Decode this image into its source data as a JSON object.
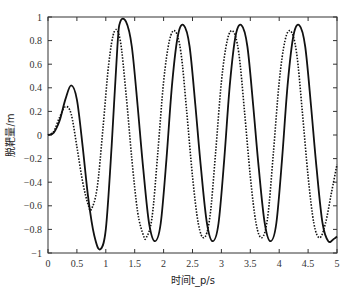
{
  "chart_data": {
    "type": "line",
    "title": "",
    "xlabel": "时间t_p/s",
    "ylabel": "脱靶量/m",
    "xlim": [
      0,
      5
    ],
    "ylim": [
      -1,
      1
    ],
    "xticks": [
      0,
      0.5,
      1,
      1.5,
      2,
      2.5,
      3,
      3.5,
      4,
      4.5,
      5
    ],
    "xtick_labels": [
      "0",
      "0.5",
      "1",
      "1.5",
      "2",
      "2.5",
      "3",
      "3.5",
      "4",
      "4.5",
      "5"
    ],
    "yticks": [
      -1,
      -0.8,
      -0.6,
      -0.4,
      -0.2,
      0,
      0.2,
      0.4,
      0.6,
      0.8,
      1
    ],
    "ytick_labels": [
      "−1",
      "−0.8",
      "−0.6",
      "−0.4",
      "−0.2",
      "0",
      "0.2",
      "0.4",
      "0.6",
      "0.8",
      "1"
    ],
    "grid": false,
    "legend": null,
    "series": [
      {
        "name": "solid",
        "style": "solid",
        "color": "#111111",
        "x": [
          0,
          0.1,
          0.2,
          0.3,
          0.4,
          0.5,
          0.6,
          0.7,
          0.8,
          0.9,
          1.0,
          1.1,
          1.2,
          1.25,
          1.35,
          1.45,
          1.55,
          1.65,
          1.75,
          1.85,
          1.95,
          2.05,
          2.15,
          2.25,
          2.35,
          2.45,
          2.55,
          2.65,
          2.75,
          2.85,
          2.95,
          3.05,
          3.15,
          3.25,
          3.35,
          3.45,
          3.55,
          3.65,
          3.75,
          3.85,
          3.95,
          4.05,
          4.15,
          4.25,
          4.35,
          4.45,
          4.55,
          4.65,
          4.75,
          4.85,
          4.95,
          5.0
        ],
        "y": [
          0,
          0.02,
          0.12,
          0.3,
          0.42,
          0.3,
          -0.1,
          -0.55,
          -0.85,
          -0.97,
          -0.8,
          -0.1,
          0.75,
          0.96,
          0.96,
          0.75,
          0.25,
          -0.3,
          -0.75,
          -0.9,
          -0.75,
          -0.2,
          0.45,
          0.85,
          0.93,
          0.75,
          0.25,
          -0.3,
          -0.75,
          -0.9,
          -0.75,
          -0.2,
          0.45,
          0.85,
          0.93,
          0.75,
          0.25,
          -0.3,
          -0.75,
          -0.9,
          -0.75,
          -0.2,
          0.45,
          0.85,
          0.93,
          0.75,
          0.25,
          -0.3,
          -0.75,
          -0.9,
          -0.88,
          -0.86
        ]
      },
      {
        "name": "dotted",
        "style": "dotted",
        "color": "#111111",
        "x": [
          0,
          0.1,
          0.2,
          0.3,
          0.4,
          0.5,
          0.6,
          0.7,
          0.75,
          0.85,
          0.95,
          1.05,
          1.15,
          1.25,
          1.35,
          1.45,
          1.55,
          1.65,
          1.7,
          1.8,
          1.9,
          2.0,
          2.1,
          2.2,
          2.3,
          2.4,
          2.5,
          2.6,
          2.7,
          2.8,
          2.9,
          3.0,
          3.1,
          3.2,
          3.3,
          3.4,
          3.5,
          3.6,
          3.7,
          3.8,
          3.9,
          4.0,
          4.1,
          4.2,
          4.3,
          4.4,
          4.5,
          4.6,
          4.7,
          4.8,
          4.9,
          5.0
        ],
        "y": [
          0,
          0.03,
          0.15,
          0.24,
          0.18,
          -0.1,
          -0.4,
          -0.6,
          -0.63,
          -0.45,
          0.05,
          0.6,
          0.88,
          0.8,
          0.35,
          -0.2,
          -0.65,
          -0.85,
          -0.87,
          -0.7,
          -0.15,
          0.45,
          0.8,
          0.88,
          0.7,
          0.2,
          -0.35,
          -0.75,
          -0.87,
          -0.7,
          -0.15,
          0.45,
          0.8,
          0.88,
          0.7,
          0.2,
          -0.35,
          -0.75,
          -0.87,
          -0.7,
          -0.15,
          0.45,
          0.8,
          0.88,
          0.7,
          0.2,
          -0.35,
          -0.75,
          -0.87,
          -0.75,
          -0.5,
          -0.25
        ]
      }
    ]
  }
}
